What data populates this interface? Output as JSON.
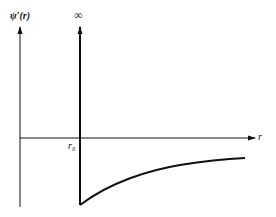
{
  "diagram": {
    "y_axis_label": "ψ′(r)",
    "x_axis_label": "r",
    "singularity_label": "∞",
    "tick_label": "r₀"
  },
  "colors": {
    "stroke": "#111111",
    "background": "#ffffff"
  }
}
